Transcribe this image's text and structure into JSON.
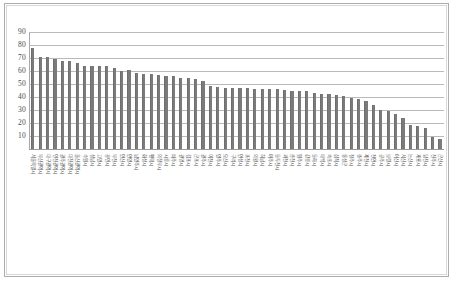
{
  "figure": {
    "frame_color": "#adadad",
    "background": "#ffffff"
  },
  "chart_data": {
    "type": "bar",
    "title": "",
    "subtitle": "",
    "xlabel": "",
    "ylabel": "",
    "ylim": [
      0,
      90
    ],
    "ytick_step": 10,
    "yticks": [
      "90",
      "80",
      "70",
      "60",
      "50",
      "40",
      "30",
      "20",
      "10"
    ],
    "grid": true,
    "legend": false,
    "legend_position": "none",
    "bar_color": "#7b7b7b",
    "gridline_color": "#b9b9b9",
    "orientation": "vertical",
    "sorted": "descending",
    "series_count": 1,
    "categories": [
      "서울특별시",
      "부산광역시",
      "대구광역시",
      "인천광역시",
      "광주광역시",
      "대전광역시",
      "울산광역시",
      "수원시",
      "성남시",
      "고양시",
      "용인시",
      "부천시",
      "안산시",
      "안양시",
      "남양주시",
      "화성시",
      "평택시",
      "의정부시",
      "시흥시",
      "파주시",
      "광명시",
      "김포시",
      "군포시",
      "광주시",
      "이천시",
      "양주시",
      "오산시",
      "구리시",
      "안성시",
      "포천시",
      "의왕시",
      "하남시",
      "여주시",
      "동두천시",
      "과천시",
      "춘천시",
      "원주시",
      "강릉시",
      "동해시",
      "태백시",
      "속초시",
      "삼척시",
      "홍성군",
      "청주시",
      "충주시",
      "제천시",
      "천안시",
      "공주시",
      "보령시",
      "아산시",
      "서산시",
      "논산시",
      "계룡시",
      "당진시",
      "전주시",
      "군산시"
    ],
    "values": [
      78,
      71,
      71,
      69,
      67.5,
      67.5,
      66.5,
      64,
      64,
      64,
      64,
      62,
      60,
      60.5,
      58.5,
      58,
      58,
      57,
      56,
      56,
      55,
      54.5,
      54,
      52.5,
      48.5,
      48,
      47,
      47,
      47,
      47,
      46.5,
      46.5,
      46.5,
      46,
      45.5,
      45,
      45,
      45,
      43,
      42.5,
      42,
      41.5,
      41,
      39,
      38.5,
      37,
      34,
      30,
      29.5,
      27,
      24,
      18.5,
      17.5,
      16.5,
      9.5,
      8
    ]
  }
}
